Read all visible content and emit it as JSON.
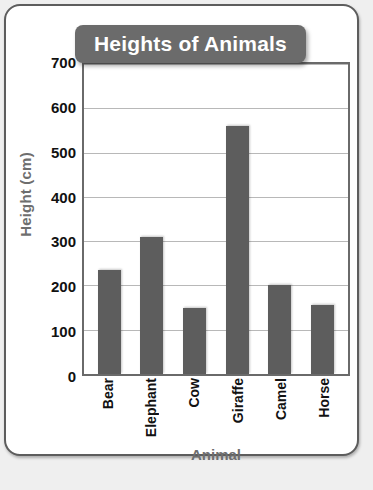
{
  "chart_data": {
    "type": "bar",
    "title": "Heights of Animals",
    "xlabel": "Animal",
    "ylabel": "Height (cm)",
    "categories": [
      "Bear",
      "Elephant",
      "Cow",
      "Giraffe",
      "Camel",
      "Horse"
    ],
    "values": [
      235,
      310,
      150,
      560,
      200,
      155
    ],
    "ylim": [
      0,
      700
    ],
    "ytick_step": 100,
    "yticks": [
      "0",
      "100",
      "200",
      "300",
      "400",
      "500",
      "600",
      "700"
    ],
    "grid": true,
    "legend": false,
    "bar_color": "#5d5d5d",
    "title_banner_color": "#6b6b6b",
    "title_text_color": "#ffffff",
    "axis_label_color": "#6e6e6e",
    "tick_label_color": "#111111",
    "gridline_color": "#b8b8b8",
    "frame_color": "#6a6a6a",
    "page_background": "#ffffff",
    "outer_background": "#efefef"
  }
}
